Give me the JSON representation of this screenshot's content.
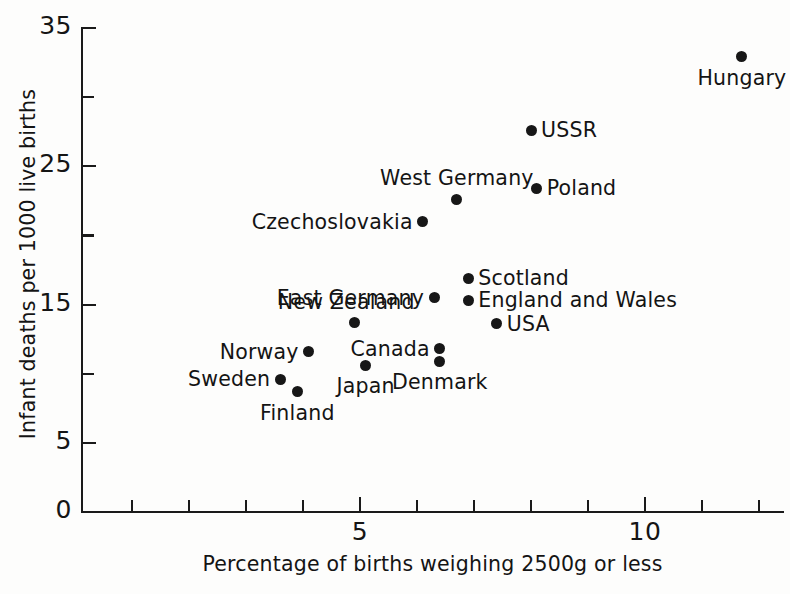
{
  "chart_data": {
    "type": "scatter",
    "title": "",
    "xlabel": "Percentage of births weighing 2500g or less",
    "ylabel": "Infant deaths per 1000 live births",
    "xlim": [
      0.1,
      12.4
    ],
    "ylim": [
      0,
      35
    ],
    "grid": false,
    "legend": "none",
    "x_ticks_major": [
      5,
      10
    ],
    "x_ticks_major_labels": [
      "5",
      "10"
    ],
    "x_ticks_minor": [
      1,
      2,
      3,
      4,
      6,
      7,
      8,
      9,
      11,
      12
    ],
    "y_ticks_major": [
      0,
      5,
      15,
      25,
      35
    ],
    "y_ticks_major_labels": [
      "0",
      "5",
      "15",
      "25",
      "35"
    ],
    "y_ticks_minor": [
      10,
      20,
      30
    ],
    "points": [
      {
        "label": "Hungary",
        "x": 11.7,
        "y": 32.9,
        "label_pos": "below"
      },
      {
        "label": "USSR",
        "x": 8.0,
        "y": 27.6,
        "label_pos": "right"
      },
      {
        "label": "Poland",
        "x": 8.1,
        "y": 23.4,
        "label_pos": "right"
      },
      {
        "label": "West Germany",
        "x": 6.7,
        "y": 22.6,
        "label_pos": "above"
      },
      {
        "label": "Czechoslovakia",
        "x": 6.1,
        "y": 21.0,
        "label_pos": "left"
      },
      {
        "label": "Scotland",
        "x": 6.9,
        "y": 16.9,
        "label_pos": "right"
      },
      {
        "label": "England and Wales",
        "x": 6.9,
        "y": 15.3,
        "label_pos": "right"
      },
      {
        "label": "East Germany",
        "x": 6.3,
        "y": 15.5,
        "label_pos": "left"
      },
      {
        "label": "USA",
        "x": 7.4,
        "y": 13.6,
        "label_pos": "right"
      },
      {
        "label": "New Zealand",
        "x": 4.9,
        "y": 13.7,
        "label_pos": "above-left"
      },
      {
        "label": "Canada",
        "x": 6.4,
        "y": 11.8,
        "label_pos": "left"
      },
      {
        "label": "Denmark",
        "x": 6.4,
        "y": 10.9,
        "label_pos": "below"
      },
      {
        "label": "Japan",
        "x": 5.1,
        "y": 10.6,
        "label_pos": "below"
      },
      {
        "label": "Norway",
        "x": 4.1,
        "y": 11.6,
        "label_pos": "left"
      },
      {
        "label": "Sweden",
        "x": 3.6,
        "y": 9.6,
        "label_pos": "left"
      },
      {
        "label": "Finland",
        "x": 3.9,
        "y": 8.7,
        "label_pos": "below"
      }
    ]
  }
}
